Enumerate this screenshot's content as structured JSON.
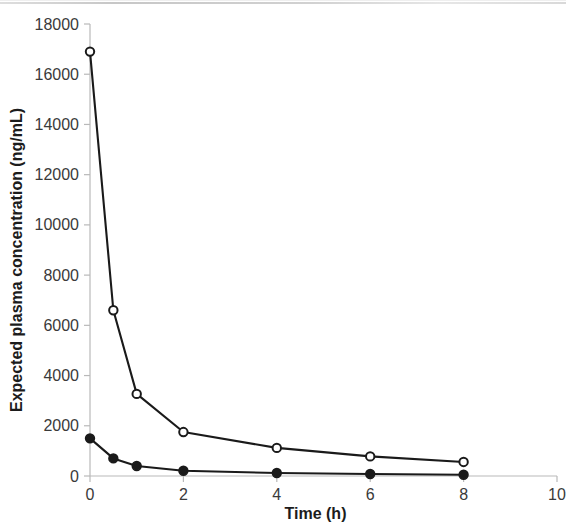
{
  "chart_data": {
    "type": "line",
    "title": "",
    "subtitle": "",
    "xlabel": "Time (h)",
    "ylabel": "Expected plasma concentration (ng/mL)",
    "xlim": [
      0,
      10
    ],
    "ylim": [
      0,
      18000
    ],
    "xticks": [
      0,
      2,
      4,
      6,
      8,
      10
    ],
    "xtick_labels": [
      "0",
      "2",
      "4",
      "6",
      "8",
      "10"
    ],
    "yticks": [
      0,
      2000,
      4000,
      6000,
      8000,
      10000,
      12000,
      14000,
      16000,
      18000
    ],
    "ytick_labels": [
      "0",
      "2000",
      "4000",
      "6000",
      "8000",
      "10000",
      "12000",
      "14000",
      "16000",
      "18000"
    ],
    "grid": false,
    "legend": null,
    "legend_position": "none",
    "x": [
      0,
      0.5,
      1,
      2,
      4,
      6,
      8
    ],
    "series": [
      {
        "name": "open-circle-series",
        "marker": "open-circle",
        "color": "#1a1a1a",
        "values": [
          16900,
          6600,
          3270,
          1750,
          1120,
          780,
          560
        ]
      },
      {
        "name": "filled-circle-series",
        "marker": "filled-circle",
        "color": "#1a1a1a",
        "values": [
          1500,
          700,
          400,
          210,
          120,
          80,
          50
        ]
      }
    ],
    "colors": {
      "axis": "#b9b9b9",
      "line": "#1a1a1a",
      "text": "#3a3a3a",
      "title_text": "#1c1c1c",
      "background": "#ffffff"
    }
  }
}
